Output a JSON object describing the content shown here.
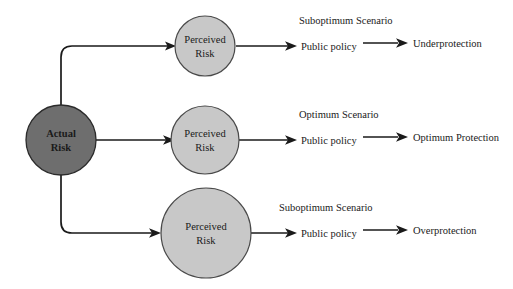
{
  "diagram": {
    "type": "flow-diagram",
    "colors": {
      "actual_risk_fill": "#6e6e6e",
      "perceived_risk_fill": "#c8c8c8",
      "node_stroke": "#2b2b2b",
      "line": "#1a1a1a",
      "background": "#ffffff",
      "text": "#1a1a1a"
    },
    "source_node": {
      "line1": "Actual",
      "line2": "Risk"
    },
    "branches": [
      {
        "id": "top",
        "perceived": {
          "line1": "Perceived",
          "line2": "Risk"
        },
        "scenario": "Suboptimum Scenario",
        "policy": "Public policy",
        "outcome": "Underprotection"
      },
      {
        "id": "middle",
        "perceived": {
          "line1": "Perceived",
          "line2": "Risk"
        },
        "scenario": "Optimum Scenario",
        "policy": "Public policy",
        "outcome": "Optimum Protection"
      },
      {
        "id": "bottom",
        "perceived": {
          "line1": "Perceived",
          "line2": "Risk"
        },
        "scenario": "Suboptimum Scenario",
        "policy": "Public policy",
        "outcome": "Overprotection"
      }
    ]
  }
}
